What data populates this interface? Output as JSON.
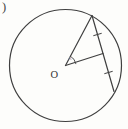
{
  "page": {
    "background": "#fdfdfb"
  },
  "colors": {
    "line": "#3f3f3f",
    "label": "#333333",
    "angle_label": "#b9a2a2"
  },
  "labels": {
    "corner_paren": ")",
    "center_point": "O",
    "central_angle": "x"
  },
  "diagram": {
    "width": 128,
    "height": 129,
    "shapes": [
      {
        "name": "circle-outline",
        "type": "circle",
        "cx": 65.5,
        "cy": 65.5,
        "r": 56,
        "strokeWidth": 1.2
      },
      {
        "name": "radius-to-top-vertex",
        "type": "line",
        "x1": 65.5,
        "y1": 65.5,
        "x2": 92,
        "y2": 15.5,
        "strokeWidth": 1.2
      },
      {
        "name": "segment-center-to-chord-midpoint",
        "type": "line",
        "x1": 65.5,
        "y1": 65.5,
        "x2": 103,
        "y2": 53.5,
        "strokeWidth": 1.2
      },
      {
        "name": "chord-top-to-lower-right",
        "type": "line",
        "x1": 92,
        "y1": 15.5,
        "x2": 114,
        "y2": 91.5,
        "strokeWidth": 1.2
      },
      {
        "name": "tick-upper-chord-segment",
        "type": "line",
        "x1": 93.7,
        "y1": 35.6,
        "x2": 101.3,
        "y2": 33.4,
        "strokeWidth": 1.0
      },
      {
        "name": "tick-lower-chord-segment",
        "type": "line",
        "x1": 104.7,
        "y1": 73.6,
        "x2": 112.3,
        "y2": 71.4,
        "strokeWidth": 1.0
      },
      {
        "name": "angle-arc",
        "type": "path",
        "d": "M 70.4 56.2 A 10.5 10.5 0 0 1 75.9 63.7",
        "strokeWidth": 0.9
      },
      {
        "name": "center-label",
        "type": "text",
        "x": 50.5,
        "y": 77.5,
        "text": "O",
        "size": 10.5,
        "fill": "#333333",
        "italic": false
      },
      {
        "name": "angle-label",
        "type": "text",
        "x": 68.8,
        "y": 59.5,
        "text": "x",
        "size": 7,
        "fill": "#b9a2a2",
        "italic": true
      },
      {
        "name": "problem-paren",
        "type": "text",
        "x": 2,
        "y": 11,
        "text": ")",
        "size": 12.5,
        "fill": "#444444",
        "italic": false
      }
    ]
  }
}
